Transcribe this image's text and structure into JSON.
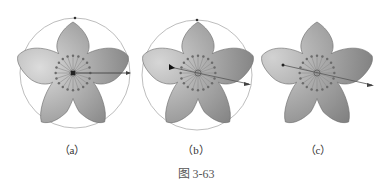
{
  "figures": [
    {
      "id": "a",
      "label": "（a）",
      "has_circle": true
    },
    {
      "id": "b",
      "label": "（b）",
      "has_circle": true
    },
    {
      "id": "c",
      "label": "（c）",
      "has_circle": false
    }
  ],
  "caption": "图 3-63",
  "colors": {
    "petal_light": "#d8d8d8",
    "petal_dark": "#8a8a8a",
    "outline": "#6a6a6a",
    "circle": "#b5b5b5",
    "spoke": "#888888",
    "dot": "#6b6b6b"
  }
}
